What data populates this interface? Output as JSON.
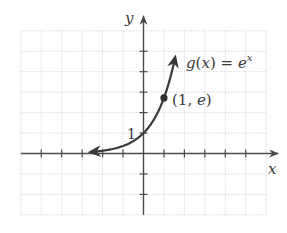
{
  "chart_data": {
    "type": "line",
    "title": "",
    "function_label": "g(x) = e^x",
    "function_label_parts": {
      "lhs": "g(x) = e",
      "exp": "x"
    },
    "xlabel": "x",
    "ylabel": "y",
    "xlim": [
      -6,
      6
    ],
    "ylim": [
      -3,
      6
    ],
    "grid": true,
    "x_ticks": [
      -5,
      -4,
      -3,
      -2,
      -1,
      1,
      2,
      3,
      4,
      5
    ],
    "y_ticks": [
      -2,
      -1,
      1,
      2,
      3,
      4,
      5
    ],
    "tick_labels": [
      {
        "axis": "y",
        "value": 1,
        "text": "1"
      }
    ],
    "series": [
      {
        "name": "g(x) = e^x",
        "function": "exp(x)",
        "x_range": [
          -2.6,
          1.55
        ],
        "arrows": "both",
        "x": [
          -2.6,
          -2,
          -1.5,
          -1,
          -0.5,
          0,
          0.5,
          1,
          1.25,
          1.55
        ],
        "y": [
          0.074,
          0.135,
          0.223,
          0.368,
          0.607,
          1,
          1.649,
          2.718,
          3.49,
          4.71
        ]
      }
    ],
    "annotations": [
      {
        "type": "point",
        "x": 1,
        "y": 2.718,
        "text": "(1, e)"
      },
      {
        "type": "point",
        "x": 0,
        "y": 1,
        "text": "1"
      }
    ]
  },
  "labels": {
    "x_axis": "x",
    "y_axis": "y",
    "y_one": "1",
    "func_lhs": "g(x) = e",
    "func_exp": "x",
    "point": "(1, e)"
  },
  "colors": {
    "axis": "#4a4a4a",
    "curve": "#3a3a3a",
    "grid": "#d6d6d6"
  }
}
